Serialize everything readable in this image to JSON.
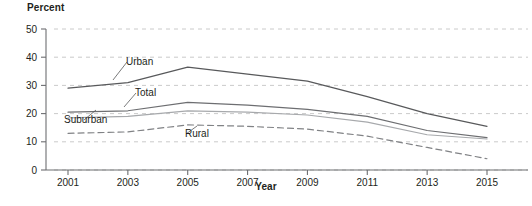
{
  "figure": {
    "background_color": "#ffffff",
    "axis_color": "#6d6e71",
    "grid_color": "#bcbcbc",
    "text_color": "#231f20"
  },
  "axes": {
    "y_title": "Percent",
    "x_title": "Year"
  },
  "caption": {
    "text": ""
  },
  "chart_data": {
    "type": "line",
    "title": "",
    "subtitle": "",
    "xlabel": "Year",
    "ylabel": "Percent",
    "x": [
      2001,
      2003,
      2005,
      2007,
      2009,
      2011,
      2013,
      2015
    ],
    "xtick_labels": [
      "2001",
      "2003",
      "2005",
      "2007",
      "2009",
      "2011",
      "2013",
      "2015"
    ],
    "xlim": [
      2000,
      2016
    ],
    "ylim": [
      0,
      50
    ],
    "ytick_labels": [
      "0",
      "10",
      "20",
      "30",
      "40",
      "50"
    ],
    "yticks": [
      0,
      10,
      20,
      30,
      40,
      50
    ],
    "grid": "horizontal-dashed",
    "legend": "inline-labels",
    "series": [
      {
        "name": "Urban",
        "label": "Urban",
        "color": "#58595b",
        "style": "solid",
        "width": 1.2,
        "values": [
          29,
          31,
          36.5,
          34,
          31.5,
          26,
          20,
          15.5
        ]
      },
      {
        "name": "Total",
        "label": "Total",
        "color": "#6d6e71",
        "style": "solid",
        "width": 1.2,
        "values": [
          20.5,
          21,
          24,
          23,
          21.5,
          19,
          14,
          11.5
        ]
      },
      {
        "name": "Suburban",
        "label": "Suburban",
        "color": "#a7a9ac",
        "style": "solid",
        "width": 1.2,
        "values": [
          18.5,
          19,
          21,
          20.5,
          19.5,
          17,
          12.5,
          11
        ]
      },
      {
        "name": "Rural",
        "label": "Rural",
        "color": "#808285",
        "style": "dashed",
        "width": 1.2,
        "values": [
          13,
          13.5,
          16,
          15.5,
          14.5,
          12,
          8,
          4
        ]
      }
    ],
    "annotations": [
      {
        "text": "Urban",
        "series": "Urban",
        "x": 126,
        "y": 65
      },
      {
        "text": "Total",
        "series": "Total",
        "x": 135,
        "y": 96
      },
      {
        "text": "Suburban",
        "series": "Suburban",
        "x": 64,
        "y": 123
      },
      {
        "text": "Rural",
        "series": "Rural",
        "x": 185,
        "y": 137
      }
    ]
  }
}
